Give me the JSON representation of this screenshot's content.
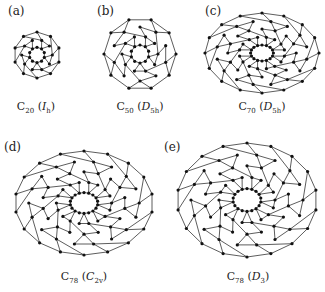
{
  "figure": {
    "panels": [
      {
        "id": "a",
        "label": "(a)",
        "molecule": "C",
        "atoms": "20",
        "sym_open": " (",
        "sym": "I",
        "sym_sub": "h",
        "sym_close": ")",
        "cx": 37,
        "cy": 55,
        "rx": 23,
        "ry": 23,
        "rings": 3,
        "spokes": 10,
        "label_x": 8,
        "label_y": 4,
        "caption_x": 36,
        "caption_y": 100
      },
      {
        "id": "b",
        "label": "(b)",
        "molecule": "C",
        "atoms": "50",
        "sym_open": " (",
        "sym": "D",
        "sym_sub": "5h",
        "sym_close": ")",
        "cx": 140,
        "cy": 54,
        "rx": 36,
        "ry": 36,
        "rings": 4,
        "spokes": 10,
        "label_x": 97,
        "label_y": 4,
        "caption_x": 140,
        "caption_y": 100
      },
      {
        "id": "c",
        "label": "(c)",
        "molecule": "C",
        "atoms": "70",
        "sym_open": " (",
        "sym": "D",
        "sym_sub": "5h",
        "sym_close": ")",
        "cx": 262,
        "cy": 53,
        "rx": 57,
        "ry": 40,
        "rings": 5,
        "spokes": 16,
        "label_x": 205,
        "label_y": 4,
        "caption_x": 262,
        "caption_y": 100
      },
      {
        "id": "d",
        "label": "(d)",
        "molecule": "C",
        "atoms": "78",
        "sym_open": " (",
        "sym": "C",
        "sym_sub": "2v",
        "sym_close": ")",
        "cx": 84,
        "cy": 203,
        "rx": 69,
        "ry": 52,
        "rings": 5,
        "spokes": 18,
        "label_x": 4,
        "label_y": 140,
        "caption_x": 84,
        "caption_y": 270
      },
      {
        "id": "e",
        "label": "(e)",
        "molecule": "C",
        "atoms": "78",
        "sym_open": " (",
        "sym": "D",
        "sym_sub": "3",
        "sym_close": ")",
        "cx": 247,
        "cy": 200,
        "rx": 70,
        "ry": 57,
        "rings": 5,
        "spokes": 18,
        "label_x": 164,
        "label_y": 140,
        "caption_x": 248,
        "caption_y": 270
      }
    ]
  },
  "styles": {
    "line_color": "#333333",
    "atom_color": "#111111",
    "background": "#ffffff"
  }
}
